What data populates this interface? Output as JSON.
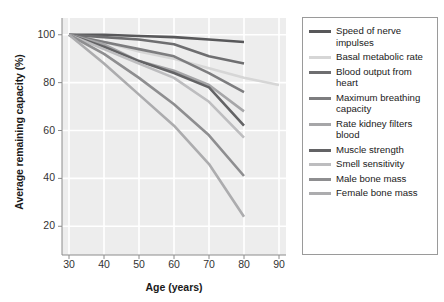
{
  "chart_data": {
    "type": "line",
    "title": "",
    "xlabel": "Age (years)",
    "ylabel": "Average remaining capacity (%)",
    "xlim": [
      28,
      92
    ],
    "ylim": [
      8,
      107
    ],
    "xticks": [
      30,
      40,
      50,
      60,
      70,
      80,
      90
    ],
    "yticks": [
      20,
      40,
      60,
      80,
      100
    ],
    "grid": true,
    "legend_position": "right",
    "background": "#ededed",
    "gridline_color": "#ffffff",
    "series": [
      {
        "name": "Speed of nerve impulses",
        "color": "#58585a",
        "x": [
          30,
          40,
          50,
          60,
          70,
          80
        ],
        "values": [
          100,
          100,
          99.5,
          99,
          98,
          97
        ]
      },
      {
        "name": "Basal metabolic rate",
        "color": "#d6d6d6",
        "x": [
          30,
          40,
          50,
          60,
          70,
          80,
          90
        ],
        "values": [
          100,
          97,
          93,
          90,
          86,
          82,
          79
        ]
      },
      {
        "name": "Blood output from heart",
        "color": "#6e6e70",
        "x": [
          30,
          40,
          50,
          60,
          70,
          80
        ],
        "values": [
          100,
          99,
          98,
          96,
          91,
          88
        ]
      },
      {
        "name": "Maximum breathing capacity",
        "color": "#7d7d7f",
        "x": [
          30,
          40,
          50,
          60,
          70,
          80
        ],
        "values": [
          100,
          97,
          94,
          91,
          84,
          76
        ]
      },
      {
        "name": "Rate kidney filters blood",
        "color": "#a6a6a8",
        "x": [
          30,
          40,
          50,
          60,
          70,
          80
        ],
        "values": [
          100,
          96,
          89,
          85,
          79,
          68
        ]
      },
      {
        "name": "Muscle strength",
        "color": "#636365",
        "x": [
          30,
          40,
          50,
          60,
          70,
          80
        ],
        "values": [
          100,
          95,
          89,
          84,
          78,
          62
        ]
      },
      {
        "name": "Smell sensitivity",
        "color": "#bdbdbf",
        "x": [
          30,
          40,
          50,
          60,
          70,
          80
        ],
        "values": [
          100,
          94,
          88,
          82,
          72,
          57
        ]
      },
      {
        "name": "Male bone mass",
        "color": "#8e8e90",
        "x": [
          30,
          40,
          50,
          60,
          70,
          80
        ],
        "values": [
          100,
          92,
          82,
          71,
          58,
          41
        ]
      },
      {
        "name": "Female bone mass",
        "color": "#acacae",
        "x": [
          30,
          40,
          50,
          60,
          70,
          80
        ],
        "values": [
          100,
          88,
          75,
          62,
          46,
          24
        ]
      }
    ]
  },
  "legend": {
    "items": [
      {
        "label": "Speed of nerve impulses",
        "color": "#58585a"
      },
      {
        "label": "Basal metabolic rate",
        "color": "#d6d6d6"
      },
      {
        "label": "Blood output from heart",
        "color": "#6e6e70"
      },
      {
        "label": "Maximum breathing capacity",
        "color": "#7d7d7f"
      },
      {
        "label": "Rate kidney filters blood",
        "color": "#a6a6a8"
      },
      {
        "label": "Muscle strength",
        "color": "#636365"
      },
      {
        "label": "Smell sensitivity",
        "color": "#bdbdbf"
      },
      {
        "label": "Male bone mass",
        "color": "#8e8e90"
      },
      {
        "label": "Female bone mass",
        "color": "#acacae"
      }
    ]
  },
  "axes": {
    "x_title": "Age (years)",
    "y_title": "Average remaining capacity (%)",
    "x_tick_labels": [
      "30",
      "40",
      "50",
      "60",
      "70",
      "80",
      "90"
    ],
    "y_tick_labels": [
      "20",
      "40",
      "60",
      "80",
      "100"
    ]
  }
}
